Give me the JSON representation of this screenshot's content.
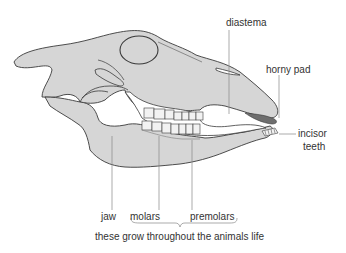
{
  "diagram": {
    "colors": {
      "bone": "#d6d6d6",
      "outline": "#3a3a3a",
      "teeth": "#f2f2f2",
      "horny_pad": "#6e6e6e",
      "leader": "#888888",
      "text": "#333333"
    },
    "labels": {
      "diastema": "diastema",
      "horny_pad": "horny pad",
      "incisor_line1": "incisor",
      "incisor_line2": "teeth",
      "jaw": "jaw",
      "molars": "molars",
      "premolars": "premolars",
      "caption": "these grow throughout the animals life"
    }
  }
}
